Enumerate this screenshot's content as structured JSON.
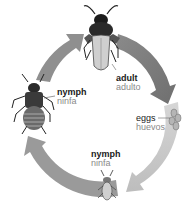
{
  "stages": [
    {
      "id": "adult",
      "en": "adult",
      "es": "adulto"
    },
    {
      "id": "eggs",
      "en": "eggs",
      "es": "huevos"
    },
    {
      "id": "nymph-small",
      "en": "nymph",
      "es": "ninfa"
    },
    {
      "id": "nymph-large",
      "en": "nymph",
      "es": "ninfa"
    }
  ],
  "arrows": {
    "direction": "clockwise",
    "colors": {
      "adult_to_eggs": "#7d7d7d",
      "eggs_to_nymph": "#c8c8c8",
      "nymph_to_nymph": "#9a9a9a",
      "nymph_to_adult": "#8f8f8f"
    }
  }
}
